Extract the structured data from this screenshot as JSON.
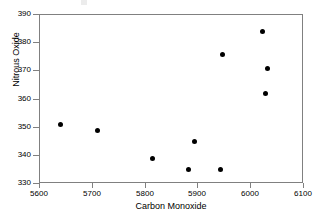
{
  "chart_data": {
    "type": "scatter",
    "title": "",
    "xlabel": "Carbon Monoxide",
    "ylabel": "Nitrous Oxide",
    "xlim": [
      5600,
      6100
    ],
    "ylim": [
      330,
      390
    ],
    "xticks": [
      5600,
      5700,
      5800,
      5900,
      6000,
      6100
    ],
    "yticks": [
      330,
      340,
      350,
      360,
      370,
      380,
      390
    ],
    "xtick_labels": [
      "5600",
      "5700",
      "5800",
      "5900",
      "6000",
      "6100"
    ],
    "ytick_labels": [
      "330",
      "340",
      "350",
      "360",
      "370",
      "380",
      "390"
    ],
    "grid": false,
    "legend": null,
    "marker": "filled-circle",
    "marker_color": "#000000",
    "series": [
      {
        "name": "observations",
        "points": [
          {
            "x": 5638,
            "y": 351
          },
          {
            "x": 5708,
            "y": 349
          },
          {
            "x": 5814,
            "y": 339
          },
          {
            "x": 5882,
            "y": 335
          },
          {
            "x": 5893,
            "y": 345
          },
          {
            "x": 5941,
            "y": 335
          },
          {
            "x": 5945,
            "y": 376
          },
          {
            "x": 6021,
            "y": 384
          },
          {
            "x": 6028,
            "y": 362
          },
          {
            "x": 6031,
            "y": 371
          }
        ]
      }
    ]
  }
}
